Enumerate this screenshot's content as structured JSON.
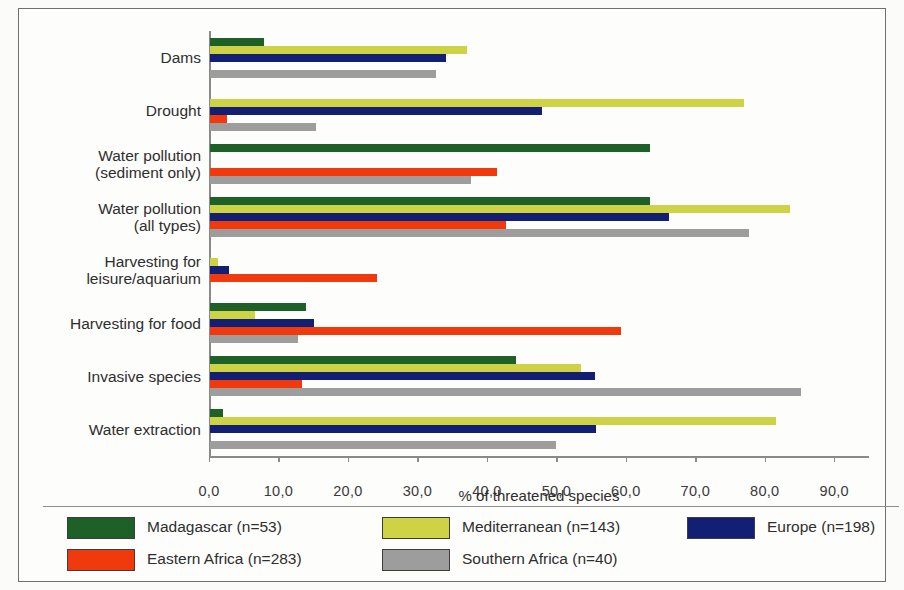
{
  "chart_data": {
    "type": "bar",
    "orientation": "horizontal",
    "title": "",
    "xlabel": "% of threatened species",
    "ylabel": "",
    "xlim": [
      0,
      95
    ],
    "xticks": [
      "0,0",
      "10,0",
      "20,0",
      "30,0",
      "40,0",
      "50,0",
      "60,0",
      "70,0",
      "80,0",
      "90,0"
    ],
    "xtick_values": [
      0,
      10,
      20,
      30,
      40,
      50,
      60,
      70,
      80,
      90
    ],
    "grid": false,
    "legend_position": "bottom",
    "categories": [
      "Dams",
      "Drought",
      "Water pollution (sediment only)",
      "Water pollution (all types)",
      "Harvesting for leisure/aquarium",
      "Harvesting for food",
      "Invasive species",
      "Water extraction"
    ],
    "category_lines": [
      [
        "Dams"
      ],
      [
        "Drought"
      ],
      [
        "Water pollution",
        "(sediment only)"
      ],
      [
        "Water pollution",
        "(all types)"
      ],
      [
        "Harvesting for",
        "leisure/aquarium"
      ],
      [
        "Harvesting for food"
      ],
      [
        "Invasive species"
      ],
      [
        "Water extraction"
      ]
    ],
    "series": [
      {
        "name": "Madagascar (n=53)",
        "color": "#1d6128",
        "values": [
          7.8,
          0.0,
          63.4,
          63.4,
          0.0,
          13.8,
          44.0,
          1.8
        ]
      },
      {
        "name": "Mediterranean (n=143)",
        "color": "#cdd345",
        "values": [
          37.0,
          76.9,
          0.0,
          83.5,
          1.1,
          6.5,
          53.4,
          81.5
        ]
      },
      {
        "name": "Europe (n=198)",
        "color": "#131f72",
        "values": [
          34.0,
          47.8,
          0.0,
          66.0,
          2.8,
          14.9,
          55.4,
          55.5
        ]
      },
      {
        "name": "Eastern Africa (n=283)",
        "color": "#f03a0e",
        "values": [
          0.0,
          2.5,
          41.3,
          42.6,
          24.0,
          59.2,
          13.2,
          0.0
        ]
      },
      {
        "name": "Southern Africa (n=40)",
        "color": "#9d9d9d",
        "values": [
          32.5,
          15.2,
          37.6,
          77.6,
          0.0,
          12.6,
          85.0,
          49.8
        ]
      }
    ]
  },
  "legend": {
    "items": [
      {
        "label": "Madagascar (n=53)",
        "color": "#1d6128"
      },
      {
        "label": "Mediterranean (n=143)",
        "color": "#cdd345"
      },
      {
        "label": "Europe (n=198)",
        "color": "#131f72"
      },
      {
        "label": "Eastern Africa (n=283)",
        "color": "#f03a0e"
      },
      {
        "label": "Southern Africa (n=40)",
        "color": "#9d9d9d"
      }
    ]
  }
}
